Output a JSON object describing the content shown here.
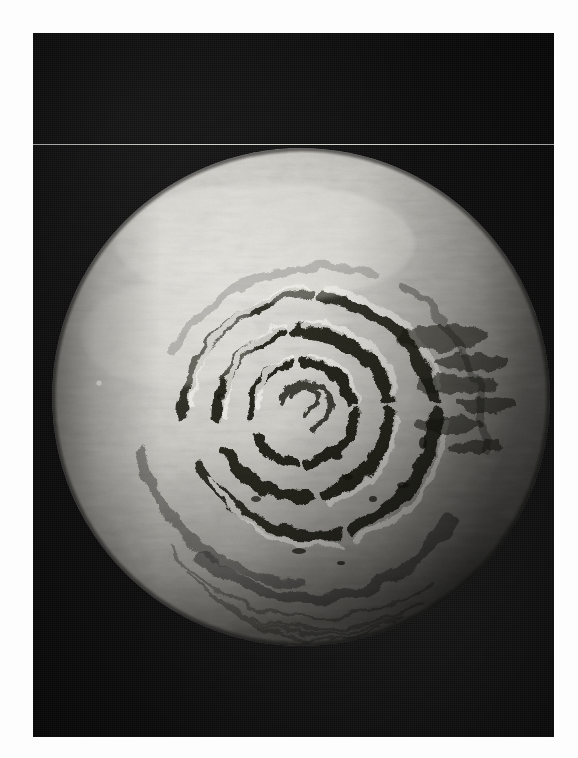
{
  "page": {
    "kind": "photographic-print",
    "background_color": "#fdfdfd",
    "width": 578,
    "height": 758
  },
  "plate": {
    "name": "dark-photographic-plate",
    "left": 33,
    "top": 33,
    "width": 521,
    "height": 704,
    "sky_color": "#0d0c0c",
    "has_film_grain": true,
    "scan_line_y": 144,
    "scan_line_color": "#d2d2cd"
  },
  "subject": {
    "name": "planetary-polar-cap",
    "description": "Grayscale spacecraft image of a planetary north polar ice cap showing spiral troughs",
    "disk": {
      "center_x": 301,
      "center_y": 397,
      "radius_x": 250,
      "radius_y": 250
    },
    "illumination": {
      "bright_side": "upper-left",
      "limb_darkening": true,
      "terminator": "right-and-lower-limb"
    },
    "surface_tones": {
      "highlight": "#e8e6e1",
      "midtone": "#a9a7a1",
      "shadow": "#2a2926",
      "trough_dark": "#14130f"
    },
    "features": [
      {
        "label": "central-polar-swirl",
        "kind": "spiral-core"
      },
      {
        "label": "inner-trough-ring",
        "kind": "dark-arc"
      },
      {
        "label": "middle-trough-ring",
        "kind": "dark-arc"
      },
      {
        "label": "outer-trough-ring",
        "kind": "dark-arc"
      },
      {
        "label": "eastern-scarp-field",
        "kind": "mottled-terrain"
      },
      {
        "label": "bright-northern-plateau",
        "kind": "smooth-highlight"
      },
      {
        "label": "southern-limb-ridges",
        "kind": "lineated-terrain"
      }
    ]
  },
  "chart_data": null
}
